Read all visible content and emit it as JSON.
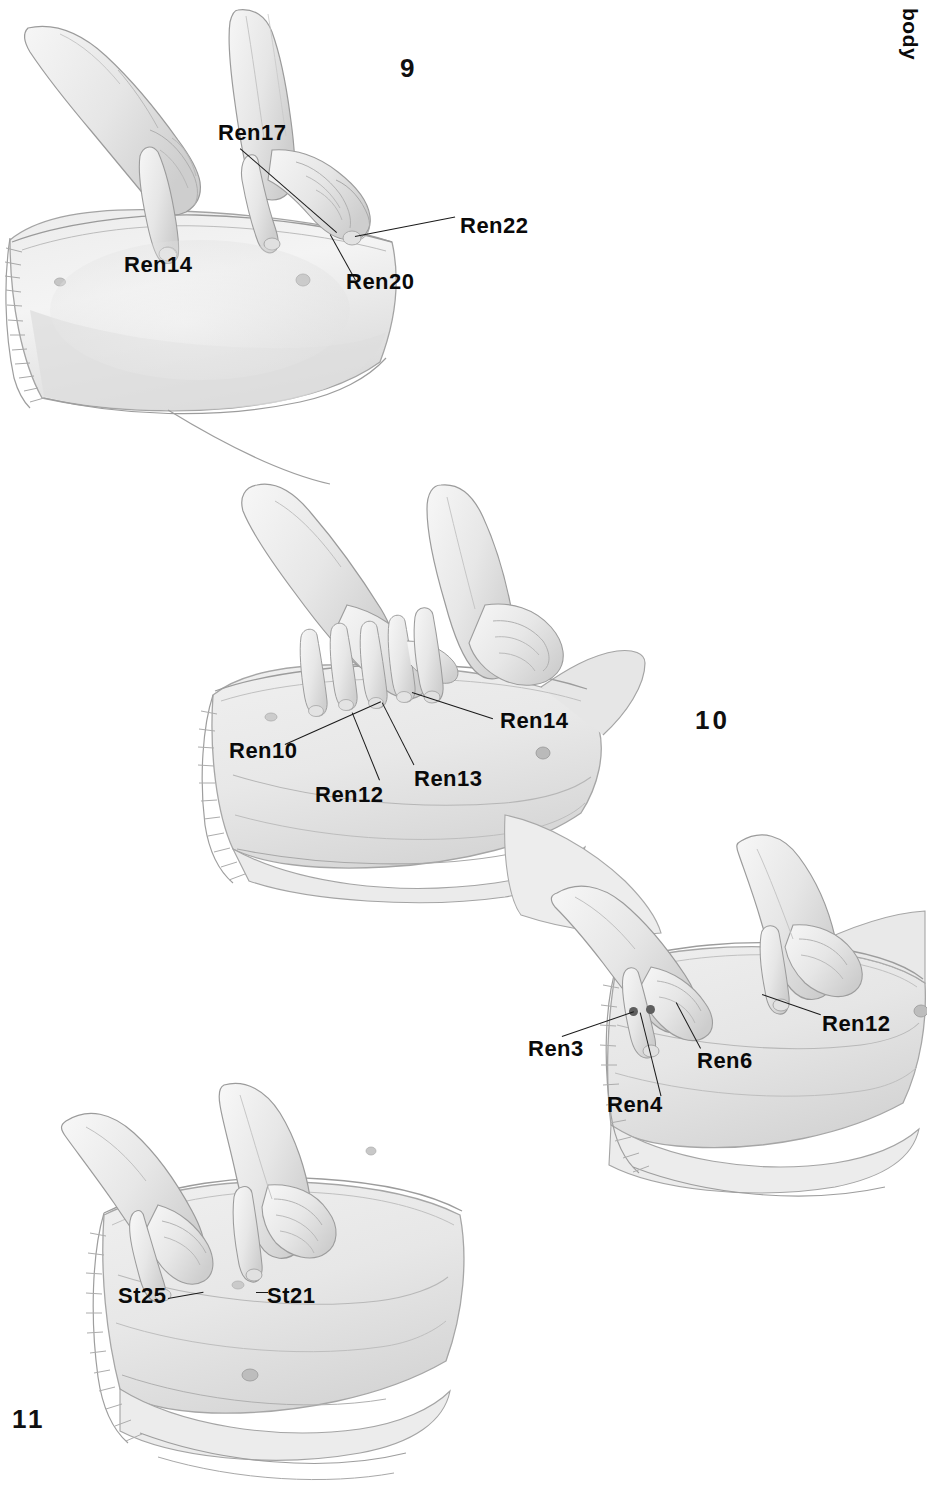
{
  "page": {
    "running_head": "body",
    "background_color": "#ffffff",
    "width": 927,
    "height": 1488
  },
  "figures": [
    {
      "id": "figure-9",
      "number": "9",
      "number_x": 400,
      "number_y": 55,
      "description": "Practitioner's two hands pressing points on a reclining patient's upper chest/torso",
      "labels": [
        {
          "name": "Ren17",
          "x": 218,
          "y": 122,
          "anchor_x": 283,
          "anchor_y": 232
        },
        {
          "name": "Ren22",
          "x": 460,
          "y": 215,
          "anchor_x": 352,
          "anchor_y": 234
        },
        {
          "name": "Ren20",
          "x": 346,
          "y": 273,
          "anchor_x": 327,
          "anchor_y": 232
        },
        {
          "name": "Ren14",
          "x": 124,
          "y": 254,
          "anchor_x": null,
          "anchor_y": null
        }
      ]
    },
    {
      "id": "figure-10a",
      "number": "10",
      "number_x": 695,
      "number_y": 707,
      "description": "Practitioner's two hands pressing midline abdominal points on a reclining patient",
      "labels": [
        {
          "name": "Ren10",
          "x": 229,
          "y": 742,
          "anchor_x": 312,
          "anchor_y": 700
        },
        {
          "name": "Ren12",
          "x": 315,
          "y": 786,
          "anchor_x": 356,
          "anchor_y": 712
        },
        {
          "name": "Ren13",
          "x": 414,
          "y": 770,
          "anchor_x": 385,
          "anchor_y": 702
        },
        {
          "name": "Ren14",
          "x": 500,
          "y": 712,
          "anchor_x": 413,
          "anchor_y": 692
        }
      ]
    },
    {
      "id": "figure-10b",
      "number": null,
      "description": "Practitioner's two hands pressing lower abdominal points on a reclining patient",
      "labels": [
        {
          "name": "Ren3",
          "x": 528,
          "y": 1040,
          "anchor_x": 633,
          "anchor_y": 1012
        },
        {
          "name": "Ren4",
          "x": 607,
          "y": 1096,
          "anchor_x": 649,
          "anchor_y": 1013
        },
        {
          "name": "Ren6",
          "x": 697,
          "y": 1052,
          "anchor_x": 676,
          "anchor_y": 1002
        },
        {
          "name": "Ren12",
          "x": 822,
          "y": 1015,
          "anchor_x": 765,
          "anchor_y": 994
        }
      ],
      "dots": [
        {
          "name": "Ren3-dot",
          "x": 633,
          "y": 1012
        },
        {
          "name": "Ren4-dot",
          "x": 650,
          "y": 1010
        }
      ]
    },
    {
      "id": "figure-11",
      "number": "11",
      "number_x": 12,
      "number_y": 1406,
      "description": "Practitioner's two hands pressing stomach-channel points on a reclining patient's abdomen",
      "labels": [
        {
          "name": "St25",
          "x": 118,
          "y": 1287,
          "anchor_x": 196,
          "anchor_y": 1298
        },
        {
          "name": "St21",
          "x": 267,
          "y": 1287,
          "anchor_x": 252,
          "anchor_y": 1292
        }
      ]
    }
  ],
  "colors": {
    "ink": "#0a0a0a",
    "leader_line": "#1a1a1a",
    "point_dot": "#5e5e5e",
    "skin_light": "#f2f2f2",
    "skin_mid": "#e3e3e3",
    "skin_shade": "#cfcfcf",
    "outline": "#9a9a9a",
    "cloth": "#ededed"
  }
}
